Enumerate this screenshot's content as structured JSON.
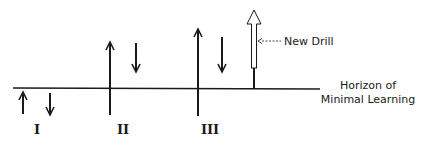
{
  "diagram": {
    "horizon_label_line1": "Horizon of",
    "horizon_label_line2": "Minimal Learning",
    "new_drill_label": "New Drill",
    "groups": [
      {
        "label": "I",
        "up_arrow": "short",
        "down_arrow": "short"
      },
      {
        "label": "II",
        "up_arrow": "tall",
        "down_arrow": "medium"
      },
      {
        "label": "III",
        "up_arrow": "taller",
        "down_arrow": "medium"
      }
    ],
    "colors": {
      "ink": "#1a1a1a",
      "background": "#ffffff"
    }
  }
}
